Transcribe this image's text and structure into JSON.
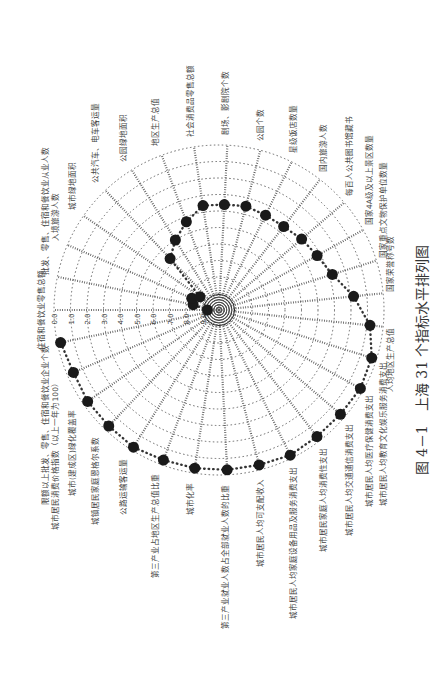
{
  "figure": {
    "caption": "图 4－1　上海 31 个指标水平排列图",
    "rotation_deg": -90
  },
  "chart_data": {
    "type": "radar",
    "title": "上海 31 个指标水平排列图",
    "figure_label": "图 4－1",
    "radial_ticks": [
      "0.0",
      "1.0",
      "2.0",
      "3.0",
      "4.0",
      "5.0",
      "6.0",
      "7.0",
      "8.0",
      "9.0",
      "10.0"
    ],
    "radial_range": [
      0,
      10
    ],
    "radial_direction": "0 at outer ring, 10 at centre",
    "grid": true,
    "categories": [
      "住宿和餐饮业零售总额",
      "批发、零售、住宿和餐饮业从业人数",
      "入境旅游人数",
      "城市绿地面积",
      "公共汽车、电车客运量",
      "公园绿地面积",
      "地区生产总值",
      "社会消费品零售总额",
      "剧场、影剧院个数",
      "公园个数",
      "星级饭店数量",
      "国内旅游人数",
      "每百人公共图书馆藏书",
      "国家4A级及以上景区数量",
      "国家重点文物保护单位数量",
      "国家荣誉称号数",
      "人均地区生产总值",
      "城市居民人均教育文化娱乐服务消费支出",
      "城市居民人均医疗保健消费支出",
      "城市居民人均交通通信消费支出",
      "城市居民家庭人均消费性支出",
      "城市居民人均家庭设备用品及服务消费支出",
      "城市居民人均可支配收入",
      "第三产业就业人数占全部就业人数的比重",
      "城市化率",
      "第三产业占地区生产总值比重",
      "公路运输客运量",
      "城镇居民家庭恩格尔系数",
      "城市(建成区)绿化覆盖率",
      "城市居民消费价格指数（以上一年为100）",
      "限额以上批发、零售、住宿和餐饮业企业个数"
    ],
    "values": [
      9.3,
      8.4,
      8.2,
      8.6,
      5.7,
      5.0,
      4.3,
      3.6,
      3.6,
      3.5,
      3.6,
      3.6,
      3.4,
      3.2,
      2.8,
      1.8,
      0.8,
      0.3,
      0.2,
      0.3,
      0.3,
      0.2,
      0.3,
      0.3,
      0.3,
      0.3,
      0.2,
      0.3,
      0.3,
      0.4,
      0.2
    ],
    "series": [
      {
        "name": "上海",
        "marker": "filled-circle",
        "line": "dotted"
      }
    ]
  }
}
